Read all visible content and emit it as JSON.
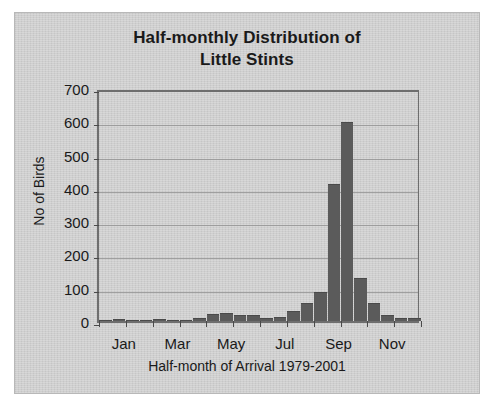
{
  "chart_data": {
    "type": "bar",
    "title": "Half-monthly Distribution of Little Stints",
    "title_line1": "Half-monthly Distribution of",
    "title_line2": "Little Stints",
    "xlabel": "Half-month of Arrival 1979-2001",
    "ylabel": "No of Birds",
    "ylim": [
      0,
      700
    ],
    "ytick_labels": [
      "700",
      "600",
      "500",
      "400",
      "300",
      "200",
      "100",
      "0"
    ],
    "ytick_values": [
      700,
      600,
      500,
      400,
      300,
      200,
      100,
      0
    ],
    "grid": true,
    "legend": "none",
    "bar_color": "#5b5b5b",
    "plot_background": "#cfcfcf",
    "xtick_labels": [
      "Jan",
      "Mar",
      "May",
      "Jul",
      "Sep",
      "Nov"
    ],
    "xtick_positions": [
      0,
      4,
      8,
      12,
      16,
      20
    ],
    "categories": [
      "Jan 1",
      "Jan 2",
      "Feb 1",
      "Feb 2",
      "Mar 1",
      "Mar 2",
      "Apr 1",
      "Apr 2",
      "May 1",
      "May 2",
      "Jun 1",
      "Jun 2",
      "Jul 1",
      "Jul 2",
      "Aug 1",
      "Aug 2",
      "Sep 1",
      "Sep 2",
      "Oct 1",
      "Oct 2",
      "Nov 1",
      "Nov 2",
      "Dec 1",
      "Dec 2"
    ],
    "values": [
      0,
      3,
      0,
      0,
      2,
      0,
      0,
      5,
      18,
      22,
      14,
      14,
      6,
      9,
      27,
      50,
      85,
      410,
      595,
      125,
      52,
      14,
      6,
      5
    ]
  }
}
